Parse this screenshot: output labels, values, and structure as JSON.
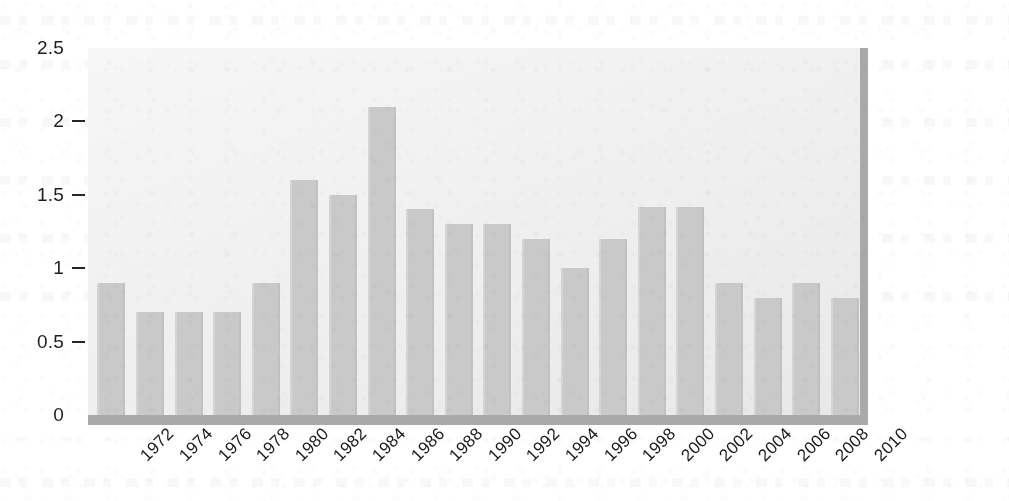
{
  "chart_data": {
    "type": "bar",
    "title": "",
    "xlabel": "",
    "ylabel": "x",
    "ylim": [
      0,
      2.5
    ],
    "grid": false,
    "legend": "none",
    "y_ticks": [
      "0",
      "0.5",
      "1",
      "1.5",
      "2",
      "2.5"
    ],
    "y_tick_values": [
      0,
      0.5,
      1,
      1.5,
      2,
      2.5
    ],
    "categories": [
      "1972",
      "1974",
      "1976",
      "1978",
      "1980",
      "1982",
      "1984",
      "1986",
      "1988",
      "1990",
      "1992",
      "1994",
      "1996",
      "1998",
      "2000",
      "2002",
      "2004",
      "2006",
      "2008",
      "2010"
    ],
    "values": [
      0.9,
      0.7,
      0.7,
      0.7,
      0.9,
      1.6,
      1.5,
      2.1,
      1.4,
      1.3,
      1.3,
      1.2,
      1.0,
      1.2,
      1.42,
      1.42,
      0.9,
      0.8,
      0.9,
      0.8
    ],
    "bar_color": "#c9c9c9",
    "panel_color": "#ececec",
    "panel_shadow_color": "#a9a9a9",
    "axis_text_color": "#1a1a1a"
  }
}
